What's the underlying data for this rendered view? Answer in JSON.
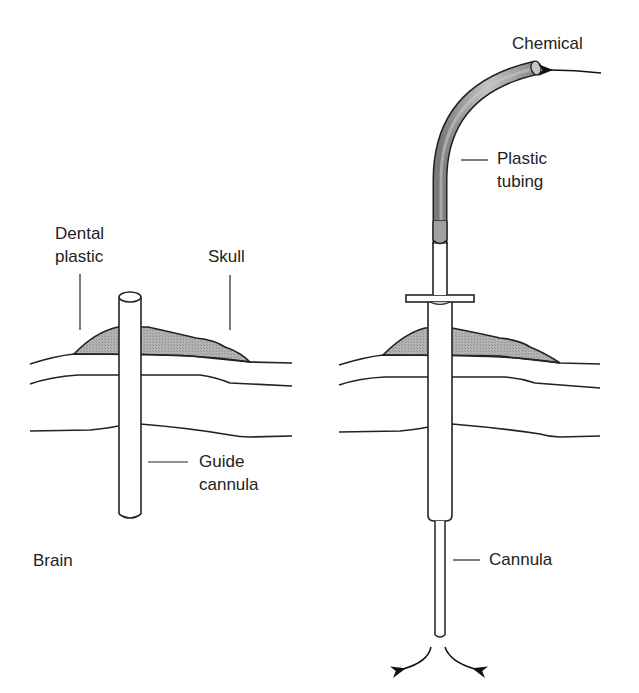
{
  "labels": {
    "chemical": "Chemical",
    "plastic_tubing_line1": "Plastic",
    "plastic_tubing_line2": "tubing",
    "dental_plastic_line1": "Dental",
    "dental_plastic_line2": "plastic",
    "skull": "Skull",
    "guide_cannula_line1": "Guide",
    "guide_cannula_line2": "cannula",
    "brain": "Brain",
    "cannula": "Cannula"
  },
  "colors": {
    "line": "#222222",
    "fill_gray": "#a8a8a8",
    "tubing_gray": "#9a9a9a",
    "background": "#ffffff"
  }
}
